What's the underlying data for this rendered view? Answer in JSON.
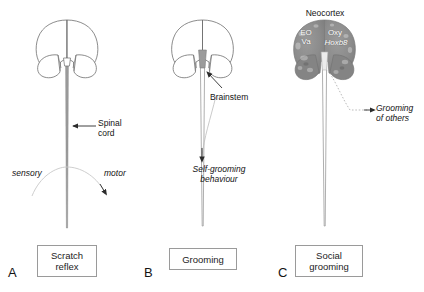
{
  "figure": {
    "type": "scientific-diagram"
  },
  "panels": [
    {
      "letter": "A",
      "caption": "Scratch\nreflex",
      "labels": {
        "spinal_cord": "Spinal\ncord",
        "sensory": "sensory",
        "motor": "motor"
      }
    },
    {
      "letter": "B",
      "caption": "Grooming",
      "labels": {
        "brainstem": "Brainstem",
        "behaviour": "Self-grooming\nbehaviour"
      }
    },
    {
      "letter": "C",
      "caption": "Social\ngrooming",
      "labels": {
        "neocortex": "Neocortex",
        "gene_left": "EO\nVa",
        "gene_right_top": "Oxy",
        "gene_right_bottom": "Hoxb8",
        "grooming_others": "Grooming\nof others"
      }
    }
  ],
  "colors": {
    "outline": "#6f6f6f",
    "cord_fill": "#9b9b9b",
    "brain_dark": "#8d8d8d",
    "arc": "#c0c0c0",
    "arrow": "#2b2b2b",
    "box_border": "#9a9a9a",
    "text": "#141414"
  }
}
